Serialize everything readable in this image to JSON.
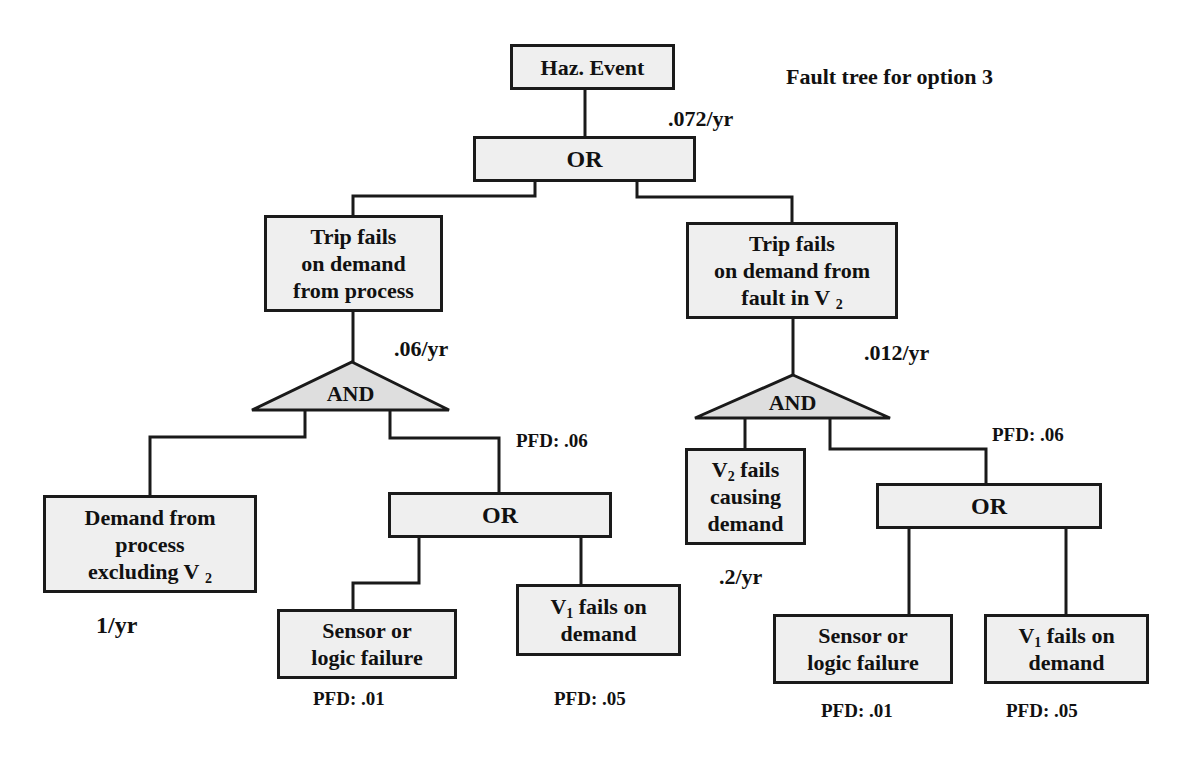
{
  "title": "Fault tree for option 3",
  "colors": {
    "box_fill": "#efefef",
    "gate_fill": "#dedede",
    "line": "#1a1a1a",
    "text": "#111111"
  },
  "top_event": {
    "label": "Haz. Event",
    "rate": ".072/yr"
  },
  "top_gate": {
    "type": "OR"
  },
  "left_branch": {
    "event": {
      "line1": "Trip fails",
      "line2": "on demand",
      "line3": "from process"
    },
    "rate": ".06/yr",
    "gate": {
      "type": "AND"
    },
    "demand": {
      "line1": "Demand from",
      "line2": "process",
      "line3": "excluding V",
      "sub": "2",
      "rate": "1/yr"
    },
    "sub_gate": {
      "type": "OR",
      "pfd": "PFD: .06"
    },
    "sensor": {
      "line1": "Sensor or",
      "line2": "logic failure",
      "pfd": "PFD: .01"
    },
    "valve": {
      "prefix": "V",
      "sub": "1",
      "line1_rest": " fails on",
      "line2": "demand",
      "pfd": "PFD: .05"
    }
  },
  "right_branch": {
    "event": {
      "line1": "Trip fails",
      "line2": "on demand from",
      "line3": "fault in V",
      "sub": "2"
    },
    "rate": ".012/yr",
    "gate": {
      "type": "AND"
    },
    "demand": {
      "prefix": "V",
      "sub": "2",
      "line1_rest": " fails",
      "line2": "causing",
      "line3": "demand",
      "rate": ".2/yr"
    },
    "sub_gate": {
      "type": "OR",
      "pfd": "PFD: .06"
    },
    "sensor": {
      "line1": "Sensor or",
      "line2": "logic failure",
      "pfd": "PFD: .01"
    },
    "valve": {
      "prefix": "V",
      "sub": "1",
      "line1_rest": " fails on",
      "line2": "demand",
      "pfd": "PFD: .05"
    }
  }
}
